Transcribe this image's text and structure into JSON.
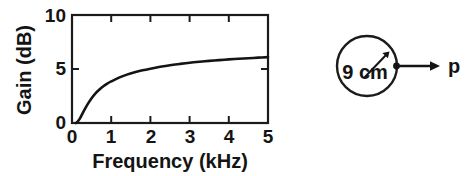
{
  "figure": {
    "background_color": "#ffffff",
    "ink_color": "#141414"
  },
  "chart_panel": {
    "name": "gain-frequency-plot",
    "y_axis_title": "Gain (dB)",
    "x_axis_title": "Frequency (kHz)",
    "x_tick_labels": [
      "0",
      "1",
      "2",
      "3",
      "4",
      "5"
    ],
    "y_tick_labels": [
      "0",
      "5",
      "10"
    ]
  },
  "diagram_panel": {
    "name": "circular-piston-diagram",
    "radius_label": "9 cm",
    "pressure_label": "p"
  },
  "chart_data": {
    "type": "line",
    "title": "",
    "xlabel": "Frequency (kHz)",
    "ylabel": "Gain (dB)",
    "xlim": [
      0,
      5
    ],
    "ylim": [
      0,
      10
    ],
    "xticks": [
      0,
      1,
      2,
      3,
      4,
      5
    ],
    "yticks": [
      0,
      5,
      10
    ],
    "grid": false,
    "legend": "none",
    "frame": "box",
    "tick_direction": "in",
    "series": [
      {
        "name": "Gain",
        "x": [
          0.1,
          0.15,
          0.2,
          0.25,
          0.3,
          0.4,
          0.5,
          0.6,
          0.7,
          0.8,
          0.9,
          1.0,
          1.2,
          1.4,
          1.6,
          1.8,
          2.0,
          2.25,
          2.5,
          2.75,
          3.0,
          3.25,
          3.5,
          3.75,
          4.0,
          4.25,
          4.5,
          4.75,
          5.0
        ],
        "y": [
          0.0,
          0.15,
          0.4,
          0.75,
          1.1,
          1.75,
          2.3,
          2.75,
          3.1,
          3.4,
          3.65,
          3.85,
          4.2,
          4.48,
          4.7,
          4.88,
          5.03,
          5.2,
          5.35,
          5.47,
          5.58,
          5.67,
          5.75,
          5.82,
          5.89,
          5.95,
          6.0,
          6.05,
          6.1
        ]
      }
    ]
  }
}
